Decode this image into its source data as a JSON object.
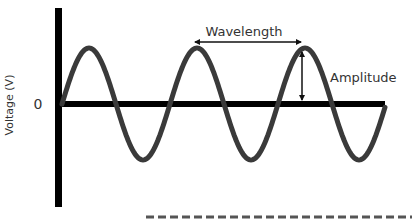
{
  "diagram": {
    "type": "sine-wave-anatomy",
    "y_axis_label": "Voltage (V)",
    "zero_label": "0",
    "annotations": {
      "wavelength": "Wavelength",
      "amplitude": "Amplitude"
    },
    "colors": {
      "axis": "#000000",
      "wave": "#3a3a3a",
      "arrow": "#111111",
      "text": "#333333",
      "dashed_line": "#555555"
    },
    "wave": {
      "cycles_visible": 2.6,
      "peaks_count": 3,
      "troughs_count": 3
    }
  }
}
